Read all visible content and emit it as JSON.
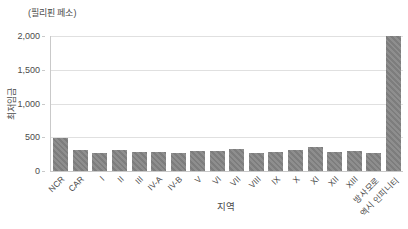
{
  "chart": {
    "unit_label": "(필리핀 페소)",
    "y_axis_label": "최저임금",
    "x_axis_label": "지역"
  },
  "chart_data": {
    "type": "bar",
    "title": "",
    "unit": "필리핀 페소",
    "xlabel": "지역",
    "ylabel": "최저임금",
    "categories": [
      "NCR",
      "CAR",
      "I",
      "II",
      "III",
      "IV-A",
      "IV-B",
      "V",
      "VI",
      "VII",
      "VIII",
      "IX",
      "X",
      "XI",
      "XII",
      "XIII",
      "방사모로",
      "엑시 인피니티"
    ],
    "values": [
      490,
      310,
      270,
      315,
      285,
      285,
      270,
      290,
      290,
      330,
      270,
      280,
      305,
      355,
      285,
      295,
      260,
      2000
    ],
    "ylim": [
      0,
      2000
    ],
    "yticks": [
      0,
      500,
      1000,
      1500,
      2000
    ],
    "ytick_labels": [
      "0",
      "500",
      "1,000",
      "1,500",
      "2,000"
    ],
    "grid": true,
    "legend": "none",
    "bar_color": "#8a8a8a",
    "bar_hatch": "diagonal",
    "gridline_color": "#e0e0e0",
    "axis_color": "#c9c9c9",
    "text_color": "#4b4b4b"
  }
}
